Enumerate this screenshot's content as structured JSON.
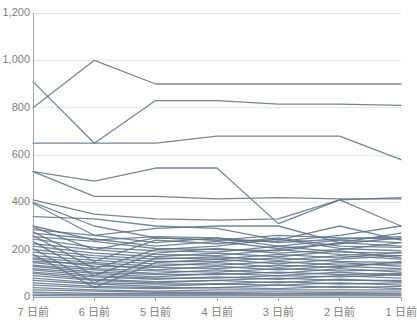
{
  "chart_data": {
    "type": "line",
    "title": "",
    "subtitle": "",
    "xlabel": "",
    "ylabel": "",
    "grid": true,
    "legend": false,
    "legend_position": "none",
    "line_color": "#5c7187",
    "axis_color": "#9aa3ad",
    "grid_color": "#e2e5e8",
    "tick_text_color": "#808080",
    "background": "#ffffff",
    "ylim": [
      0,
      1200
    ],
    "y_ticks": [
      0,
      200,
      400,
      600,
      800,
      1000,
      1200
    ],
    "y_tick_labels": [
      "0",
      "200",
      "400",
      "600",
      "800",
      "1,000",
      "1,200"
    ],
    "categories": [
      "7 日前",
      "6 日前",
      "5 日前",
      "4 日前",
      "3 日前",
      "2 日前",
      "1 日前"
    ],
    "x": [
      0,
      1,
      2,
      3,
      4,
      5,
      6
    ],
    "series": [
      {
        "name": "series-01",
        "values": [
          800,
          1000,
          900,
          900,
          900,
          900,
          900
        ]
      },
      {
        "name": "series-02",
        "values": [
          910,
          650,
          830,
          830,
          815,
          815,
          810
        ]
      },
      {
        "name": "series-03",
        "values": [
          650,
          650,
          650,
          680,
          680,
          680,
          580
        ]
      },
      {
        "name": "series-04",
        "values": [
          530,
          490,
          545,
          545,
          310,
          410,
          420
        ]
      },
      {
        "name": "series-05",
        "values": [
          530,
          425,
          425,
          415,
          420,
          415,
          415
        ]
      },
      {
        "name": "series-06",
        "values": [
          410,
          350,
          330,
          325,
          330,
          410,
          300
        ]
      },
      {
        "name": "series-07",
        "values": [
          400,
          300,
          250,
          240,
          260,
          250,
          245
        ]
      },
      {
        "name": "series-08",
        "values": [
          395,
          260,
          290,
          300,
          300,
          230,
          270
        ]
      },
      {
        "name": "series-09",
        "values": [
          340,
          330,
          300,
          290,
          240,
          300,
          240
        ]
      },
      {
        "name": "series-10",
        "values": [
          300,
          240,
          255,
          250,
          230,
          245,
          255
        ]
      },
      {
        "name": "series-11",
        "values": [
          295,
          200,
          250,
          240,
          235,
          260,
          300
        ]
      },
      {
        "name": "series-12",
        "values": [
          285,
          260,
          230,
          250,
          215,
          240,
          230
        ]
      },
      {
        "name": "series-13",
        "values": [
          275,
          150,
          240,
          225,
          250,
          215,
          210
        ]
      },
      {
        "name": "series-14",
        "values": [
          270,
          245,
          215,
          235,
          205,
          225,
          250
        ]
      },
      {
        "name": "series-15",
        "values": [
          260,
          120,
          200,
          215,
          245,
          205,
          195
        ]
      },
      {
        "name": "series-16",
        "values": [
          255,
          235,
          205,
          200,
          195,
          230,
          215
        ]
      },
      {
        "name": "series-17",
        "values": [
          245,
          210,
          195,
          190,
          215,
          190,
          185
        ]
      },
      {
        "name": "series-18",
        "values": [
          235,
          90,
          185,
          205,
          185,
          200,
          230
        ]
      },
      {
        "name": "series-19",
        "values": [
          225,
          200,
          180,
          175,
          200,
          180,
          175
        ]
      },
      {
        "name": "series-20",
        "values": [
          215,
          185,
          170,
          185,
          170,
          195,
          165
        ]
      },
      {
        "name": "series-21",
        "values": [
          205,
          60,
          165,
          160,
          180,
          165,
          190
        ]
      },
      {
        "name": "series-22",
        "values": [
          200,
          175,
          160,
          170,
          155,
          175,
          160
        ]
      },
      {
        "name": "series-23",
        "values": [
          190,
          165,
          150,
          150,
          165,
          150,
          145
        ]
      },
      {
        "name": "series-24",
        "values": [
          180,
          40,
          145,
          160,
          140,
          160,
          175
        ]
      },
      {
        "name": "series-25",
        "values": [
          175,
          155,
          140,
          135,
          150,
          135,
          140
        ]
      },
      {
        "name": "series-26",
        "values": [
          165,
          145,
          130,
          145,
          125,
          145,
          130
        ]
      },
      {
        "name": "series-27",
        "values": [
          160,
          130,
          125,
          120,
          135,
          125,
          150
        ]
      },
      {
        "name": "series-28",
        "values": [
          150,
          140,
          115,
          130,
          115,
          130,
          120
        ]
      },
      {
        "name": "series-29",
        "values": [
          145,
          120,
          110,
          105,
          120,
          110,
          115
        ]
      },
      {
        "name": "series-30",
        "values": [
          135,
          115,
          100,
          115,
          100,
          120,
          105
        ]
      },
      {
        "name": "series-31",
        "values": [
          130,
          105,
          95,
          95,
          105,
          95,
          100
        ]
      },
      {
        "name": "series-32",
        "values": [
          120,
          100,
          85,
          100,
          90,
          105,
          90
        ]
      },
      {
        "name": "series-33",
        "values": [
          115,
          90,
          80,
          80,
          90,
          85,
          95
        ]
      },
      {
        "name": "series-34",
        "values": [
          105,
          85,
          75,
          85,
          75,
          90,
          80
        ]
      },
      {
        "name": "series-35",
        "values": [
          100,
          75,
          65,
          70,
          80,
          70,
          70
        ]
      },
      {
        "name": "series-36",
        "values": [
          90,
          70,
          60,
          70,
          60,
          75,
          65
        ]
      },
      {
        "name": "series-37",
        "values": [
          80,
          60,
          55,
          55,
          65,
          55,
          60
        ]
      },
      {
        "name": "series-38",
        "values": [
          70,
          55,
          45,
          55,
          50,
          60,
          50
        ]
      },
      {
        "name": "series-39",
        "values": [
          60,
          45,
          40,
          40,
          50,
          40,
          45
        ]
      },
      {
        "name": "series-40",
        "values": [
          50,
          40,
          35,
          40,
          35,
          45,
          35
        ]
      },
      {
        "name": "series-41",
        "values": [
          40,
          30,
          25,
          30,
          30,
          30,
          30
        ]
      },
      {
        "name": "series-42",
        "values": [
          30,
          25,
          20,
          20,
          22,
          20,
          22
        ]
      },
      {
        "name": "series-43",
        "values": [
          20,
          15,
          14,
          15,
          14,
          15,
          14
        ]
      },
      {
        "name": "series-44",
        "values": [
          12,
          10,
          9,
          10,
          9,
          10,
          9
        ]
      },
      {
        "name": "series-45",
        "values": [
          6,
          5,
          5,
          5,
          5,
          5,
          5
        ]
      }
    ]
  }
}
